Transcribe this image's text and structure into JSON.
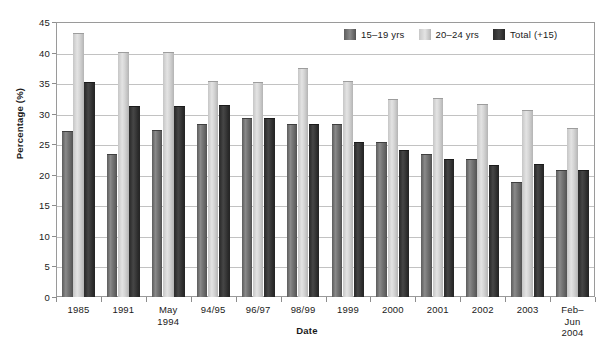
{
  "chart_data": {
    "type": "bar",
    "title": "",
    "xlabel": "Date",
    "ylabel": "Percentage (%)",
    "ylim": [
      0,
      45
    ],
    "ytick_step": 5,
    "yticks": [
      "0",
      "5",
      "10",
      "15",
      "20",
      "25",
      "30",
      "35",
      "40",
      "45"
    ],
    "grid": true,
    "legend_position": "top-right-inside",
    "categories": [
      "1985",
      "1991",
      "May\n1994",
      "94/95",
      "96/97",
      "98/99",
      "1999",
      "2000",
      "2001",
      "2002",
      "2003",
      "Feb–Jun\n2004"
    ],
    "series": [
      {
        "name": "15–19 yrs",
        "color": "#6e6e6e",
        "values": [
          27.0,
          23.3,
          27.1,
          28.2,
          29.2,
          28.2,
          28.2,
          25.2,
          23.2,
          22.5,
          18.6,
          20.6
        ]
      },
      {
        "name": "20–24 yrs",
        "color": "#d8d8d8",
        "values": [
          43.1,
          40.0,
          40.0,
          35.2,
          35.0,
          37.3,
          35.2,
          32.3,
          32.4,
          31.4,
          30.4,
          27.5
        ]
      },
      {
        "name": "Total (+15)",
        "color": "#333333",
        "values": [
          35.0,
          31.1,
          31.1,
          31.2,
          29.1,
          28.2,
          25.2,
          23.9,
          22.4,
          21.4,
          21.6,
          20.6
        ]
      }
    ]
  },
  "axes": {
    "y_title": "Percentage (%)",
    "x_title": "Date"
  },
  "legend": {
    "items": [
      {
        "label": "15–19 yrs"
      },
      {
        "label": "20–24 yrs"
      },
      {
        "label": "Total (+15)"
      }
    ]
  }
}
